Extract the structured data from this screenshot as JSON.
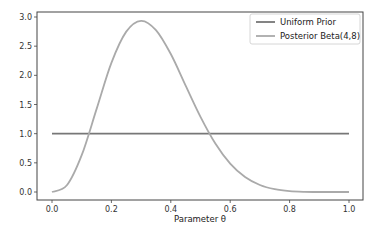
{
  "chart_data": {
    "type": "line",
    "title": "",
    "xlabel": "Parameter θ",
    "ylabel": "",
    "xlim": [
      -0.05,
      1.05
    ],
    "ylim": [
      -0.15,
      3.08
    ],
    "xticks": [
      0.0,
      0.2,
      0.4,
      0.6,
      0.8,
      1.0
    ],
    "xtick_labels": [
      "0.0",
      "0.2",
      "0.4",
      "0.6",
      "0.8",
      "1.0"
    ],
    "yticks": [
      0.0,
      0.5,
      1.0,
      1.5,
      2.0,
      2.5,
      3.0
    ],
    "ytick_labels": [
      "0.0",
      "0.5",
      "1.0",
      "1.5",
      "2.0",
      "2.5",
      "3.0"
    ],
    "grid": false,
    "legend_position": "upper right",
    "series": [
      {
        "name": "Uniform Prior",
        "color": "#777777",
        "x": [
          0.0,
          1.0
        ],
        "values": [
          1.0,
          1.0
        ]
      },
      {
        "name": "Posterior Beta(4,8)",
        "color": "#aaaaaa",
        "x": [
          0.0,
          0.05,
          0.1,
          0.15,
          0.2,
          0.25,
          0.3,
          0.35,
          0.4,
          0.45,
          0.5,
          0.55,
          0.6,
          0.65,
          0.7,
          0.75,
          0.8,
          0.85,
          0.9,
          0.95,
          1.0
        ],
        "values": [
          0.0,
          0.115,
          0.631,
          1.421,
          2.214,
          2.749,
          2.935,
          2.775,
          2.365,
          1.824,
          1.289,
          0.832,
          0.487,
          0.257,
          0.12,
          0.048,
          0.015,
          0.003,
          0.0,
          0.0,
          0.0
        ]
      }
    ]
  }
}
